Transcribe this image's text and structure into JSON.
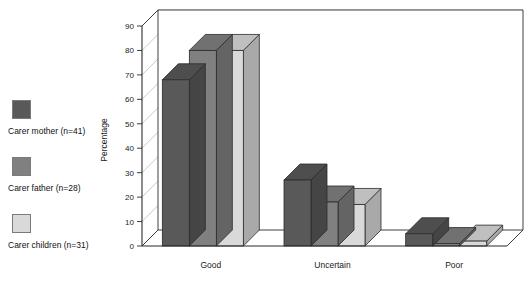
{
  "chart_data": {
    "type": "bar",
    "title": "",
    "subtitle": "",
    "xlabel": "",
    "ylabel": "Percentage",
    "categories": [
      "Good",
      "Uncertain",
      "Poor"
    ],
    "series": [
      {
        "name": "Carer mother (n=41)",
        "values": [
          68,
          27,
          5
        ],
        "color": "#595959"
      },
      {
        "name": "Carer father (n=28)",
        "values": [
          80,
          18,
          1
        ],
        "color": "#808080"
      },
      {
        "name": "Carer children (n=31)",
        "values": [
          80,
          17,
          2
        ],
        "color": "#d9d9d9"
      }
    ],
    "ylim": [
      0,
      90
    ],
    "yticks": [
      0,
      10,
      20,
      30,
      40,
      50,
      60,
      70,
      80,
      90
    ],
    "ytick_labels": [
      "0",
      "10",
      "20",
      "30",
      "40",
      "50",
      "60",
      "70",
      "80",
      "90"
    ],
    "grid": true,
    "grid_axis": "y",
    "legend_position": "left",
    "style": "3d-bar",
    "annotations": []
  },
  "legend": {
    "items": [
      {
        "label": "Carer mother (n=41)",
        "color": "#595959"
      },
      {
        "label": "Carer father (n=28)",
        "color": "#808080"
      },
      {
        "label": "Carer children (n=31)",
        "color": "#d9d9d9"
      }
    ]
  },
  "axes": {
    "y_title": "Percentage",
    "y_tick_labels": [
      "0",
      "10",
      "20",
      "30",
      "40",
      "50",
      "60",
      "70",
      "80",
      "90"
    ],
    "x_tick_labels": [
      "Good",
      "Uncertain",
      "Poor"
    ]
  },
  "colors": {
    "series_1": "#595959",
    "series_2": "#808080",
    "series_3": "#d9d9d9",
    "axis": "#2b2b2b",
    "grid": "#bdbdbd",
    "background": "#ffffff"
  }
}
